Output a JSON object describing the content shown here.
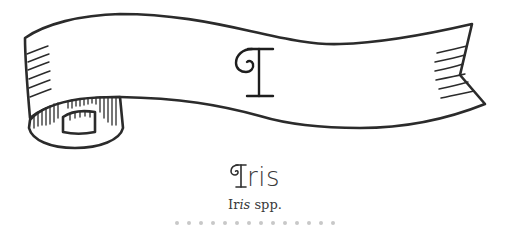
{
  "banner": {
    "letter": "I",
    "stroke_color": "#2b2b2b",
    "fill_color": "#ffffff"
  },
  "entry": {
    "title": "Iris",
    "title_initial": "I",
    "title_rest": "ris",
    "subtitle_genus_upright": "Ir",
    "subtitle_genus_italic": "is",
    "subtitle_rest": " spp.",
    "text_color": "#3a3a3a"
  },
  "divider": {
    "icon": "dotted-divider",
    "dot_count": 14,
    "dot_color": "#c8c8c8"
  }
}
